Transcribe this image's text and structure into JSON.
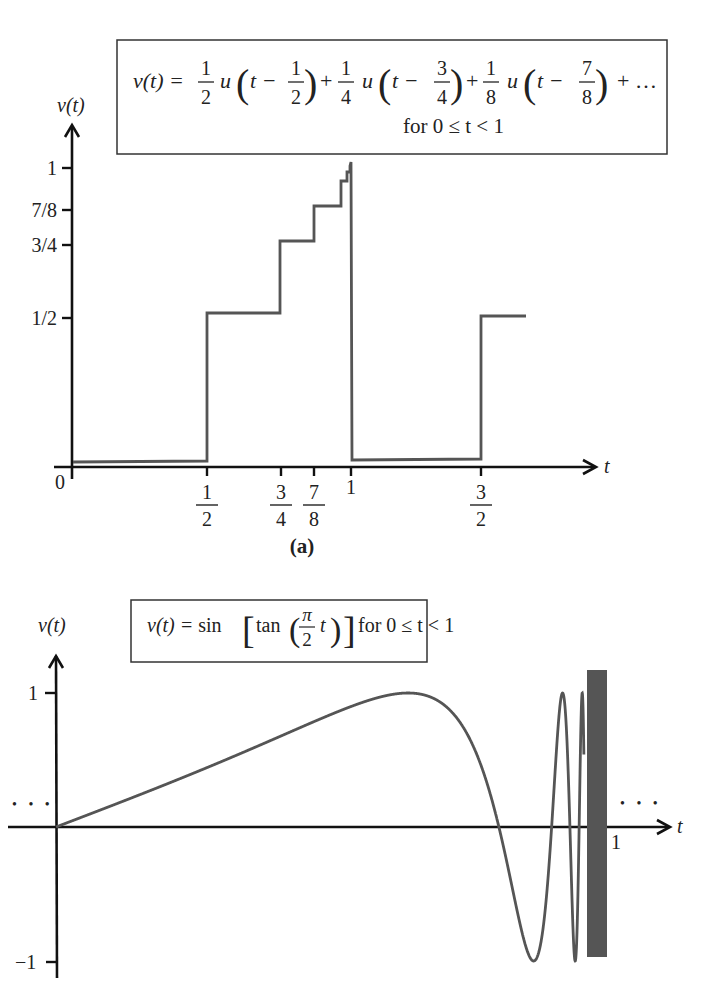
{
  "chart_data": [
    {
      "panel": "a",
      "type": "line",
      "subtype": "step",
      "title": "v(t) = 1/2 u(t - 1/2) + 1/4 u(t - 3/4) + 1/8 u(t - 7/8) + ... for 0 ≤ t < 1",
      "caption": "(a)",
      "xlabel": "t",
      "ylabel": "v(t)",
      "x_ticks": [
        "0",
        "1/2",
        "3/4",
        "7/8",
        "1",
        "3/2"
      ],
      "y_ticks": [
        "1/2",
        "3/4",
        "7/8",
        "1"
      ],
      "grid": false,
      "series": [
        {
          "name": "v(t)",
          "x": [
            0,
            0.5,
            0.5,
            0.75,
            0.75,
            0.875,
            0.875,
            0.9375,
            0.9375,
            0.96875,
            0.96875,
            1,
            1,
            1.5,
            1.5,
            1.7
          ],
          "values": [
            0,
            0,
            0.5,
            0.5,
            0.75,
            0.75,
            0.875,
            0.875,
            0.9375,
            0.9375,
            0.96875,
            1,
            0,
            0,
            0.5,
            0.5
          ]
        }
      ],
      "xlim": [
        0,
        1.75
      ],
      "ylim": [
        0,
        1.1
      ]
    },
    {
      "panel": "b",
      "type": "line",
      "title": "v(t) = sin[tan(π/2 t)] for 0 ≤ t < 1",
      "xlabel": "t",
      "ylabel": "v(t)",
      "x_ticks": [
        "1"
      ],
      "y_ticks": [
        "1",
        "-1"
      ],
      "grid": false,
      "annotations": [
        "... (left, periodic continuation)",
        "... (right, periodic continuation)"
      ],
      "series": [
        {
          "name": "sin(tan(pi/2 t))",
          "x": [
            0,
            0.1,
            0.2,
            0.3,
            0.4,
            0.5,
            0.6,
            0.637,
            0.7,
            0.75,
            0.8,
            0.85,
            0.875,
            0.9,
            0.93,
            0.95,
            1.0
          ],
          "values": [
            0,
            0.157,
            0.315,
            0.477,
            0.627,
            0.841,
            0.993,
            1.0,
            0.891,
            0.0,
            -0.898,
            -0.998,
            -0.35,
            0.06,
            "oscillating",
            "oscillating",
            "undefined"
          ]
        }
      ],
      "xlim": [
        0,
        1.1
      ],
      "ylim": [
        -1.1,
        1.2
      ]
    }
  ],
  "panel_a": {
    "formula": {
      "lhs": "v(t) =",
      "terms": [
        {
          "coef_num": "1",
          "coef_den": "2",
          "func": "u",
          "arg_pre": "t −",
          "arg_num": "1",
          "arg_den": "2"
        },
        {
          "coef_num": "1",
          "coef_den": "4",
          "func": "u",
          "arg_pre": "t −",
          "arg_num": "3",
          "arg_den": "4"
        },
        {
          "coef_num": "1",
          "coef_den": "8",
          "func": "u",
          "arg_pre": "t −",
          "arg_num": "7",
          "arg_den": "8"
        }
      ],
      "plus": "+",
      "tail": "+ …",
      "domain": "for 0 ≤ t < 1"
    },
    "ylabel": "v(t)",
    "xlabel": "t",
    "origin": "0",
    "y_ticks": [
      {
        "label": "1",
        "y": 168
      },
      {
        "label": "7/8",
        "y": 210
      },
      {
        "label": "3/4",
        "y": 245
      },
      {
        "label": "1/2",
        "y": 318
      }
    ],
    "x_ticks": [
      {
        "label": "1/2",
        "num": "1",
        "den": "2",
        "x": 207
      },
      {
        "label": "3/4",
        "num": "3",
        "den": "4",
        "x": 281
      },
      {
        "label": "7/8",
        "num": "7",
        "den": "8",
        "x": 314
      },
      {
        "label": "1",
        "num": "",
        "den": "",
        "x": 351
      },
      {
        "label": "3/2",
        "num": "3",
        "den": "2",
        "x": 481
      }
    ],
    "caption": "(a)"
  },
  "panel_b": {
    "formula": {
      "text_pre": "v(t) = sin",
      "tan": "tan",
      "num": "π",
      "den": "2",
      "var": "t",
      "domain": "for 0 ≤ t < 1"
    },
    "ylabel": "v(t)",
    "xlabel": "t",
    "y_ticks": [
      {
        "label": "1"
      },
      {
        "label": "−1"
      }
    ],
    "x_tick_label": "1",
    "ellipsis": "• • •"
  }
}
